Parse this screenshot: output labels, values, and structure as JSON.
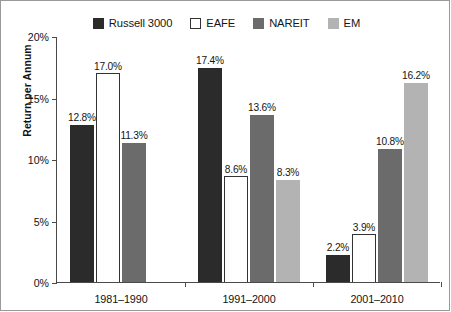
{
  "chart_data": {
    "type": "bar",
    "title": "",
    "subtitle": "",
    "xlabel": "",
    "ylabel": "Return per Annum",
    "ylim": [
      0,
      20
    ],
    "ytick_labels": [
      "0%",
      "5%",
      "10%",
      "15%",
      "20%"
    ],
    "ytick_values": [
      0,
      5,
      10,
      15,
      20
    ],
    "grid": false,
    "legend_position": "top-center",
    "value_suffix": "%",
    "categories": [
      "1981–1990",
      "1991–2000",
      "2001–2010"
    ],
    "series": [
      {
        "name": "Russell 3000",
        "color": "#2b2b2b",
        "border": "#2b2b2b",
        "values": [
          12.8,
          17.4,
          2.2
        ],
        "labels": [
          "12.8%",
          "17.4%",
          "2.2%"
        ]
      },
      {
        "name": "EAFE",
        "color": "#ffffff",
        "border": "#333333",
        "values": [
          17.0,
          8.6,
          3.9
        ],
        "labels": [
          "17.0%",
          "8.6%",
          "3.9%"
        ]
      },
      {
        "name": "NAREIT",
        "color": "#6b6b6b",
        "border": "#6b6b6b",
        "values": [
          11.3,
          13.6,
          10.8
        ],
        "labels": [
          "11.3%",
          "13.6%",
          "10.8%"
        ]
      },
      {
        "name": "EM",
        "color": "#b3b3b3",
        "border": "#b3b3b3",
        "values": [
          null,
          8.3,
          16.2
        ],
        "labels": [
          "",
          "8.3%",
          "16.2%"
        ]
      }
    ]
  },
  "legend": {
    "items": [
      {
        "label": "Russell 3000",
        "icon": "square-filled-dark-icon"
      },
      {
        "label": "EAFE",
        "icon": "square-outline-icon"
      },
      {
        "label": "NAREIT",
        "icon": "square-filled-gray-icon"
      },
      {
        "label": "EM",
        "icon": "square-filled-light-gray-icon"
      }
    ]
  },
  "axes": {
    "y_title": "Return per Annum"
  }
}
